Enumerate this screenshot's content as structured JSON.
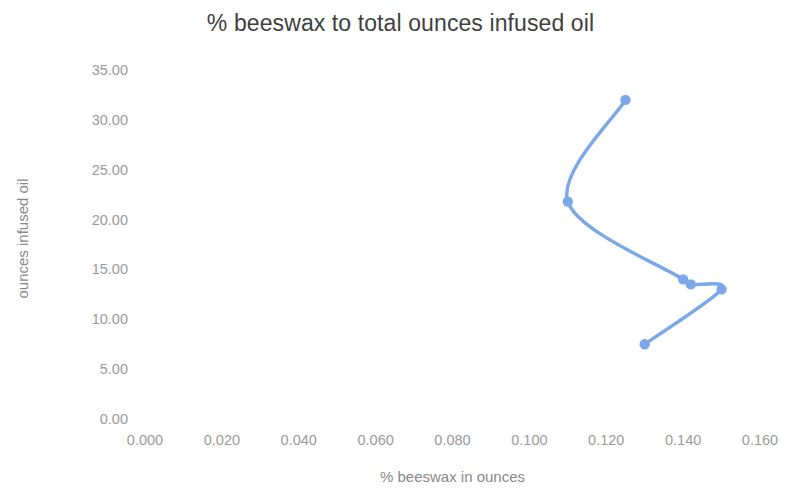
{
  "chart_data": {
    "type": "line",
    "title": "% beeswax to total ounces infused oil",
    "xlabel": "% beeswax in ounces",
    "ylabel": "ounces infused oil",
    "series": [
      {
        "name": "ounces infused oil",
        "color": "#7CA7E8",
        "marker": "circle",
        "smooth": true,
        "points": [
          {
            "x": 0.125,
            "y": 32.0
          },
          {
            "x": 0.11,
            "y": 21.8
          },
          {
            "x": 0.14,
            "y": 14.0
          },
          {
            "x": 0.142,
            "y": 13.5
          },
          {
            "x": 0.15,
            "y": 13.0
          },
          {
            "x": 0.13,
            "y": 7.5
          }
        ]
      }
    ],
    "xlim": [
      0.0,
      0.16
    ],
    "ylim": [
      0.0,
      35.0
    ],
    "xticks": [
      "0.000",
      "0.020",
      "0.040",
      "0.060",
      "0.080",
      "0.100",
      "0.120",
      "0.140",
      "0.160"
    ],
    "xtick_values": [
      0.0,
      0.02,
      0.04,
      0.06,
      0.08,
      0.1,
      0.12,
      0.14,
      0.16
    ],
    "yticks": [
      "0.00",
      "5.00",
      "10.00",
      "15.00",
      "20.00",
      "25.00",
      "30.00",
      "35.00"
    ],
    "ytick_values": [
      0,
      5,
      10,
      15,
      20,
      25,
      30,
      35
    ],
    "grid": false,
    "legend": "none",
    "background_color": "#FFFFFF",
    "title_color": "#3F3F3F",
    "tick_color": "#9A9A9A",
    "axis_label_color": "#8A8A8A"
  }
}
